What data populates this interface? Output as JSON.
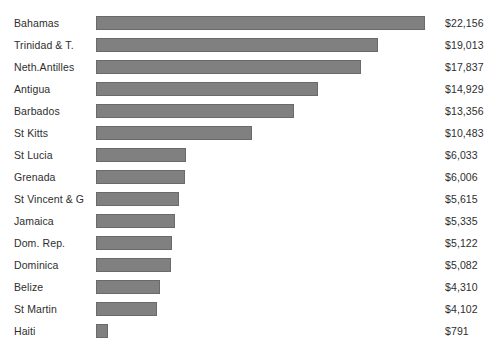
{
  "chart_data": {
    "type": "bar",
    "orientation": "horizontal",
    "title": "",
    "xlabel": "",
    "ylabel": "",
    "grid": false,
    "legend": null,
    "xlim": [
      0,
      22156
    ],
    "value_prefix": "$",
    "categories": [
      "Bahamas",
      "Trinidad & T.",
      "Neth.Antilles",
      "Antigua",
      "Barbados",
      "St Kitts",
      "St Lucia",
      "Grenada",
      "St Vincent & G",
      "Jamaica",
      "Dom. Rep.",
      "Dominica",
      "Belize",
      "St Martin",
      "Haiti"
    ],
    "values": [
      22156,
      19013,
      17837,
      14929,
      13356,
      10483,
      6033,
      6006,
      5615,
      5335,
      5122,
      5082,
      4310,
      4102,
      791
    ],
    "value_labels": [
      "$22,156",
      "$19,013",
      "$17,837",
      "$14,929",
      "$13,356",
      "$10,483",
      "$6,033",
      "$6,006",
      "$5,615",
      "$5,335",
      "$5,122",
      "$5,082",
      "$4,310",
      "$4,102",
      "$791"
    ],
    "bar_color": "#808080",
    "bar_border_color": "#6a6a6a",
    "text_color": "#2e2e2e",
    "background": "#ffffff"
  }
}
